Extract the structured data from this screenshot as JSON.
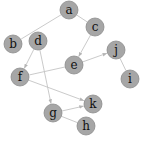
{
  "graph": {
    "title": "",
    "node_radius": 9,
    "colors": {
      "node_fill": "#a6a6a6",
      "node_stroke": "#8c8c8c",
      "edge": "#c4c4c4",
      "label": "#111111"
    },
    "nodes": [
      {
        "id": "a",
        "label": "a",
        "x": 69,
        "y": 10
      },
      {
        "id": "b",
        "label": "b",
        "x": 13,
        "y": 44
      },
      {
        "id": "c",
        "label": "c",
        "x": 95,
        "y": 27
      },
      {
        "id": "d",
        "label": "d",
        "x": 38,
        "y": 41
      },
      {
        "id": "e",
        "label": "e",
        "x": 74,
        "y": 65
      },
      {
        "id": "f",
        "label": "f",
        "x": 20,
        "y": 77
      },
      {
        "id": "g",
        "label": "g",
        "x": 53,
        "y": 113
      },
      {
        "id": "h",
        "label": "h",
        "x": 86,
        "y": 126
      },
      {
        "id": "i",
        "label": "i",
        "x": 130,
        "y": 79
      },
      {
        "id": "j",
        "label": "j",
        "x": 116,
        "y": 50
      },
      {
        "id": "k",
        "label": "k",
        "x": 93,
        "y": 104
      }
    ],
    "edges": [
      {
        "from": "a",
        "to": "b",
        "directed": false
      },
      {
        "from": "a",
        "to": "c",
        "directed": false
      },
      {
        "from": "c",
        "to": "e",
        "directed": true
      },
      {
        "from": "e",
        "to": "j",
        "directed": true
      },
      {
        "from": "j",
        "to": "i",
        "directed": false
      },
      {
        "from": "d",
        "to": "f",
        "directed": true
      },
      {
        "from": "d",
        "to": "g",
        "directed": true
      },
      {
        "from": "e",
        "to": "f",
        "directed": false
      },
      {
        "from": "f",
        "to": "k",
        "directed": true
      },
      {
        "from": "g",
        "to": "k",
        "directed": true
      },
      {
        "from": "g",
        "to": "h",
        "directed": false
      }
    ]
  }
}
